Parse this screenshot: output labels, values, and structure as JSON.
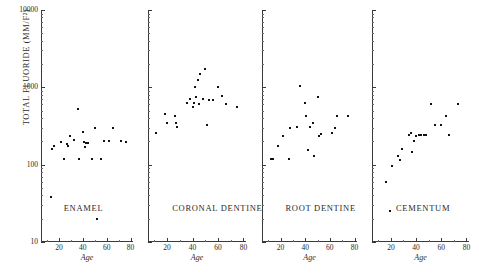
{
  "chart_data": {
    "type": "scatter",
    "title": "",
    "ylabel": "TOTAL FLUORIDE (MM/F²)",
    "xlabel": "Age",
    "yscale": "log",
    "ylim": [
      10,
      10000
    ],
    "xlim": [
      5,
      82
    ],
    "ytick_labels": [
      "10000",
      "1000",
      "100",
      "10"
    ],
    "ytick_values": [
      10000,
      1000,
      100,
      10
    ],
    "xtick_labels": [
      "20",
      "40",
      "60",
      "80"
    ],
    "xtick_values": [
      20,
      40,
      60,
      80
    ],
    "grid": false,
    "legend": "none",
    "panels": [
      {
        "label": "ENAMEL",
        "points": [
          {
            "x": 14,
            "y": 160
          },
          {
            "x": 16,
            "y": 175
          },
          {
            "x": 22,
            "y": 195
          },
          {
            "x": 24,
            "y": 120
          },
          {
            "x": 27,
            "y": 185
          },
          {
            "x": 28,
            "y": 175
          },
          {
            "x": 29,
            "y": 235
          },
          {
            "x": 33,
            "y": 210
          },
          {
            "x": 36,
            "y": 520
          },
          {
            "x": 37,
            "y": 120
          },
          {
            "x": 40,
            "y": 265
          },
          {
            "x": 41,
            "y": 195
          },
          {
            "x": 42,
            "y": 170
          },
          {
            "x": 43,
            "y": 190
          },
          {
            "x": 44,
            "y": 190
          },
          {
            "x": 48,
            "y": 120
          },
          {
            "x": 50,
            "y": 300
          },
          {
            "x": 55,
            "y": 120
          },
          {
            "x": 58,
            "y": 200
          },
          {
            "x": 62,
            "y": 205
          },
          {
            "x": 65,
            "y": 300
          },
          {
            "x": 72,
            "y": 200
          },
          {
            "x": 76,
            "y": 195
          },
          {
            "x": 13,
            "y": 38
          },
          {
            "x": 52,
            "y": 20
          }
        ]
      },
      {
        "label": "CORONAL DENTINE",
        "points": [
          {
            "x": 11,
            "y": 255
          },
          {
            "x": 18,
            "y": 450
          },
          {
            "x": 20,
            "y": 345
          },
          {
            "x": 26,
            "y": 420
          },
          {
            "x": 27,
            "y": 350
          },
          {
            "x": 28,
            "y": 305
          },
          {
            "x": 36,
            "y": 620
          },
          {
            "x": 38,
            "y": 700
          },
          {
            "x": 40,
            "y": 560
          },
          {
            "x": 41,
            "y": 620
          },
          {
            "x": 42,
            "y": 1000
          },
          {
            "x": 43,
            "y": 760
          },
          {
            "x": 44,
            "y": 1250
          },
          {
            "x": 45,
            "y": 600
          },
          {
            "x": 46,
            "y": 1500
          },
          {
            "x": 48,
            "y": 700
          },
          {
            "x": 50,
            "y": 1750
          },
          {
            "x": 51,
            "y": 330
          },
          {
            "x": 53,
            "y": 690
          },
          {
            "x": 56,
            "y": 690
          },
          {
            "x": 60,
            "y": 1010
          },
          {
            "x": 63,
            "y": 780
          },
          {
            "x": 66,
            "y": 600
          },
          {
            "x": 75,
            "y": 560
          }
        ]
      },
      {
        "label": "ROOT DENTINE",
        "points": [
          {
            "x": 12,
            "y": 118
          },
          {
            "x": 14,
            "y": 118
          },
          {
            "x": 18,
            "y": 175
          },
          {
            "x": 22,
            "y": 235
          },
          {
            "x": 27,
            "y": 120
          },
          {
            "x": 28,
            "y": 300
          },
          {
            "x": 33,
            "y": 310
          },
          {
            "x": 36,
            "y": 1050
          },
          {
            "x": 40,
            "y": 630
          },
          {
            "x": 41,
            "y": 420
          },
          {
            "x": 42,
            "y": 155
          },
          {
            "x": 44,
            "y": 310
          },
          {
            "x": 46,
            "y": 350
          },
          {
            "x": 47,
            "y": 130
          },
          {
            "x": 50,
            "y": 760
          },
          {
            "x": 51,
            "y": 235
          },
          {
            "x": 53,
            "y": 250
          },
          {
            "x": 62,
            "y": 260
          },
          {
            "x": 64,
            "y": 300
          },
          {
            "x": 66,
            "y": 430
          },
          {
            "x": 75,
            "y": 420
          }
        ]
      },
      {
        "label": "CEMENTUM",
        "points": [
          {
            "x": 16,
            "y": 60
          },
          {
            "x": 19,
            "y": 25
          },
          {
            "x": 21,
            "y": 95
          },
          {
            "x": 26,
            "y": 130
          },
          {
            "x": 27,
            "y": 115
          },
          {
            "x": 29,
            "y": 160
          },
          {
            "x": 34,
            "y": 240
          },
          {
            "x": 36,
            "y": 255
          },
          {
            "x": 37,
            "y": 145
          },
          {
            "x": 38,
            "y": 200
          },
          {
            "x": 40,
            "y": 235
          },
          {
            "x": 42,
            "y": 240
          },
          {
            "x": 44,
            "y": 240
          },
          {
            "x": 46,
            "y": 245
          },
          {
            "x": 48,
            "y": 245
          },
          {
            "x": 52,
            "y": 600
          },
          {
            "x": 55,
            "y": 330
          },
          {
            "x": 60,
            "y": 330
          },
          {
            "x": 64,
            "y": 430
          },
          {
            "x": 66,
            "y": 240
          },
          {
            "x": 73,
            "y": 600
          }
        ]
      }
    ]
  }
}
